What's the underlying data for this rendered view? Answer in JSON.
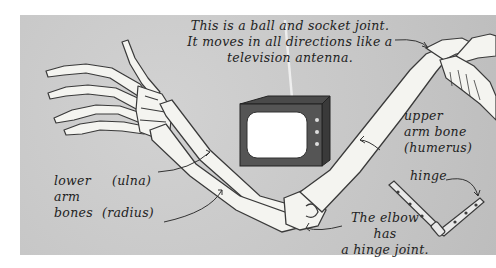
{
  "illustration": {
    "subject": "Human arm skeleton with joint analogies",
    "background_color": "#c9c9c9",
    "bone_color": "#f4f4f0",
    "outline_color": "#3a3a3a"
  },
  "labels": {
    "ball_socket": {
      "line1": "This is a ball and socket joint.",
      "line2": "It moves in all directions like a",
      "line3": "television antenna."
    },
    "upper_arm": {
      "line1": "upper",
      "line2": "arm bone",
      "line3": "(humerus)"
    },
    "hinge": "hinge",
    "lower_arm": {
      "line1": "lower",
      "line2": "arm",
      "line3": "bones",
      "ulna": "(ulna)",
      "radius": "(radius)"
    },
    "elbow": {
      "line1": "The elbow",
      "line2": "has",
      "line3": "a hinge joint."
    }
  },
  "icons": {
    "television": "tv-icon",
    "hinge": "hinge-icon"
  }
}
